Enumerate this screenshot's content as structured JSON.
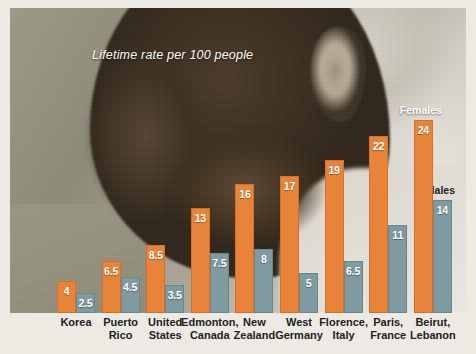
{
  "caption": "Lifetime rate per 100 people",
  "series_labels": {
    "females": "Females",
    "males": "Males"
  },
  "colors": {
    "females": "#e8843a",
    "males": "#7f9aa1",
    "value_text": "#ffffff",
    "axis_text": "#24221e",
    "caption_text": "#fdfcf8"
  },
  "chart_data": {
    "type": "bar",
    "title": "Lifetime rate per 100 people",
    "xlabel": "",
    "ylabel": "Lifetime rate per 100 people",
    "ylim": [
      0,
      24
    ],
    "grid": false,
    "legend_position": "in-plot-above-last-group",
    "categories": [
      "Korea",
      "Puerto Rico",
      "United States",
      "Edmonton, Canada",
      "New Zealand",
      "West Germany",
      "Florence, Italy",
      "Paris, France",
      "Beirut, Lebanon"
    ],
    "category_lines": [
      [
        "Korea",
        ""
      ],
      [
        "Puerto",
        "Rico"
      ],
      [
        "United",
        "States"
      ],
      [
        "Edmonton,",
        "Canada"
      ],
      [
        "New",
        "Zealand"
      ],
      [
        "West",
        "Germany"
      ],
      [
        "Florence,",
        "Italy"
      ],
      [
        "Paris,",
        "France"
      ],
      [
        "Beirut,",
        "Lebanon"
      ]
    ],
    "series": [
      {
        "name": "Females",
        "color": "#e8843a",
        "values": [
          4,
          6.5,
          8.5,
          13,
          16,
          17,
          19,
          22,
          24
        ],
        "labels": [
          "4",
          "6.5",
          "8.5",
          "13",
          "16",
          "17",
          "19",
          "22",
          "24"
        ]
      },
      {
        "name": "Males",
        "color": "#7f9aa1",
        "values": [
          2.5,
          4.5,
          3.5,
          7.5,
          8,
          5,
          6.5,
          11,
          14
        ],
        "labels": [
          "2.5",
          "4.5",
          "3.5",
          "7.5",
          "8",
          "5",
          "6.5",
          "11",
          "14"
        ]
      }
    ]
  }
}
